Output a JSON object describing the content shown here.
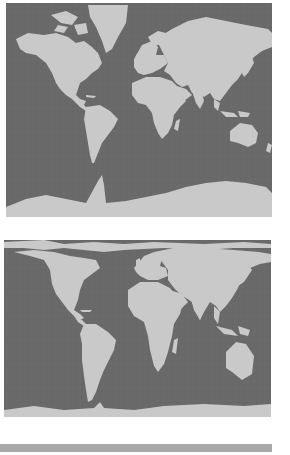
{
  "figure": {
    "maps": [
      {
        "id": "map-mercator",
        "projection": "Mercator",
        "caption": "",
        "ocean_color": "#6a6a6a",
        "land_color": "#c9c9c9",
        "grid_color": "#606060"
      },
      {
        "id": "map-equal-area",
        "projection": "Gall-Peters (equal-area)",
        "caption": "",
        "ocean_color": "#6a6a6a",
        "land_color": "#c9c9c9",
        "grid_color": "#606060"
      }
    ],
    "bottom_bar": {
      "color": "#a9a9a9"
    }
  }
}
